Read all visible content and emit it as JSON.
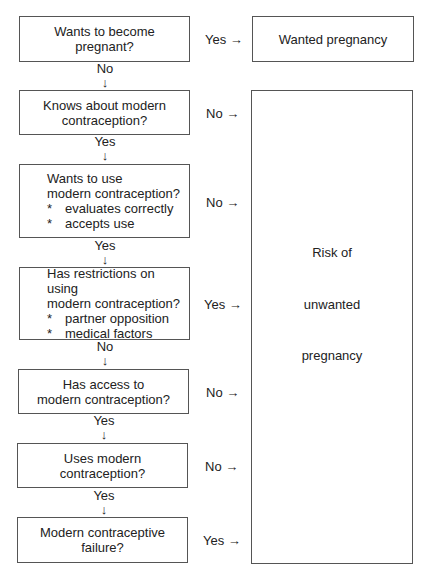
{
  "diagram": {
    "steps": [
      {
        "lines": [
          "Wants to become",
          "pregnant?"
        ],
        "side": "Yes →",
        "down": "No"
      },
      {
        "lines": [
          "Knows about modern",
          "contraception?"
        ],
        "side": "No →",
        "down": "Yes"
      },
      {
        "lines": [
          "Wants to use",
          "modern contraception?"
        ],
        "bullets": [
          "evaluates correctly",
          "accepts use"
        ],
        "side": "No →",
        "down": "Yes"
      },
      {
        "lines": [
          "Has restrictions on using",
          "modern contraception?"
        ],
        "bullets": [
          "partner opposition",
          "medical factors"
        ],
        "side": "Yes →",
        "down": "No"
      },
      {
        "lines": [
          "Has access to",
          "modern contraception?"
        ],
        "side": "No →",
        "down": "Yes"
      },
      {
        "lines": [
          "Uses modern",
          "contraception?"
        ],
        "side": "No →",
        "down": "Yes"
      },
      {
        "lines": [
          "Modern contraceptive",
          "failure?"
        ],
        "side": "Yes →"
      }
    ],
    "bullet_marker": "*",
    "down_arrow": "↓",
    "outcome_wanted": "Wanted pregnancy",
    "outcome_risk": [
      "Risk of",
      "unwanted",
      "pregnancy"
    ]
  }
}
